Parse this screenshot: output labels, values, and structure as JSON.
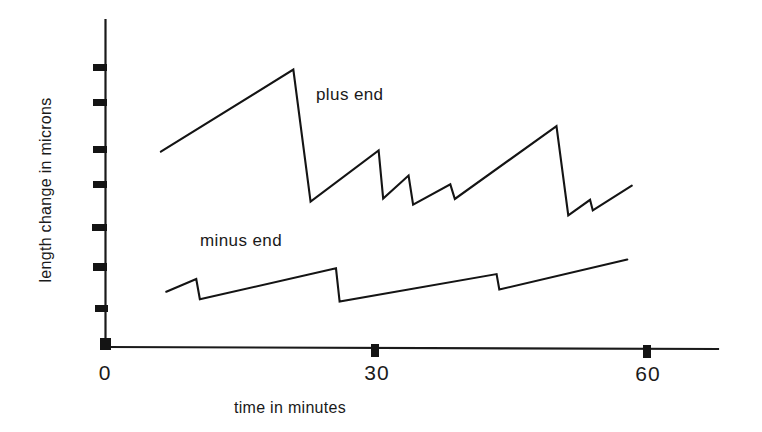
{
  "chart_data": {
    "type": "line",
    "title": "",
    "subtitle": "",
    "xlabel": "time in minutes",
    "ylabel": "length change in microns",
    "xlim": [
      0,
      67.5
    ],
    "ylim": [
      0,
      7.4
    ],
    "grid": false,
    "legend_position": "inline-annotation",
    "x_ticks": [
      "0",
      "30",
      "60"
    ],
    "x_tick_values": [
      0,
      30,
      60
    ],
    "y_ticks": [
      "",
      "",
      "",
      "",
      "",
      "",
      "",
      ""
    ],
    "y_tick_values": [
      0,
      0.88,
      1.79,
      2.63,
      3.57,
      4.34,
      5.39,
      6.16
    ],
    "annotations": [
      {
        "text": "plus  end",
        "x": 34.5,
        "y": 5.1
      },
      {
        "text": "minus  end",
        "x": 16.5,
        "y": 2.0
      }
    ],
    "series": [
      {
        "name": "plus end",
        "description": "dynamic instability trace of the plus end: long growth phases punctuated by rapid shortening events",
        "points": [
          {
            "x": 6.1,
            "y": 4.42
          },
          {
            "x": 20.7,
            "y": 6.28
          },
          {
            "x": 22.6,
            "y": 3.29
          },
          {
            "x": 30.1,
            "y": 4.45
          },
          {
            "x": 30.6,
            "y": 3.36
          },
          {
            "x": 33.4,
            "y": 3.88
          },
          {
            "x": 33.9,
            "y": 3.22
          },
          {
            "x": 38.0,
            "y": 3.68
          },
          {
            "x": 38.5,
            "y": 3.35
          },
          {
            "x": 49.7,
            "y": 5.0
          },
          {
            "x": 51.0,
            "y": 2.98
          },
          {
            "x": 53.4,
            "y": 3.33
          },
          {
            "x": 53.7,
            "y": 3.09
          },
          {
            "x": 58.0,
            "y": 3.65
          }
        ]
      },
      {
        "name": "minus end",
        "description": "dynamic instability trace of the minus end: slower growth with smaller, less frequent shortening events",
        "points": [
          {
            "x": 6.7,
            "y": 1.25
          },
          {
            "x": 10.0,
            "y": 1.54
          },
          {
            "x": 10.4,
            "y": 1.08
          },
          {
            "x": 25.4,
            "y": 1.78
          },
          {
            "x": 25.8,
            "y": 1.03
          },
          {
            "x": 43.1,
            "y": 1.65
          },
          {
            "x": 43.4,
            "y": 1.3
          },
          {
            "x": 57.5,
            "y": 1.98
          }
        ]
      }
    ]
  },
  "axes": {
    "y_axis_name": "length-change-axis",
    "x_axis_name": "time-axis"
  }
}
